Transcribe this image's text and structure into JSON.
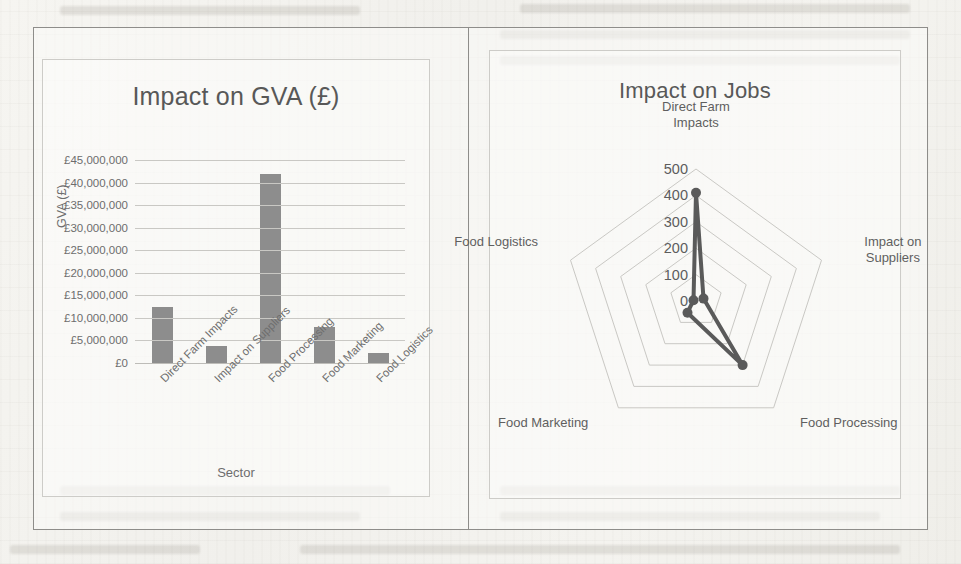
{
  "page": {
    "background_color": "#f3f2ee",
    "frame_border_color": "#8e8d8a",
    "chart_border_color": "#cdccc8"
  },
  "charts": {
    "gva": {
      "title": "Impact on GVA (£)",
      "xlabel": "Sector",
      "ylabel": "GVA (£)",
      "series_color": "#8d8d8d",
      "yticks": [
        "£0",
        "£5,000,000",
        "£10,000,000",
        "£15,000,000",
        "£20,000,000",
        "£25,000,000",
        "£30,000,000",
        "£35,000,000",
        "£40,000,000",
        "£45,000,000"
      ],
      "categories": [
        "Direct Farm Impacts",
        "Impact on Suppliers",
        "Food Processing",
        "Food Marketing",
        "Food Logistics"
      ]
    },
    "jobs": {
      "title": "Impact on Jobs",
      "series_color": "#5a5a5a",
      "grid_color": "#c9c8c4",
      "ticks": [
        "0",
        "100",
        "200",
        "300",
        "400",
        "500"
      ],
      "axis_labels": [
        "Direct Farm\nImpacts",
        "Impact on\nSuppliers",
        "Food Processing",
        "Food Marketing",
        "Food Logistics"
      ]
    }
  },
  "chart_data": [
    {
      "type": "bar",
      "title": "Impact on GVA (£)",
      "xlabel": "Sector",
      "ylabel": "GVA (£)",
      "ylim": [
        0,
        45000000
      ],
      "ytick_step": 5000000,
      "grid": true,
      "legend": "none",
      "categories": [
        "Direct Farm Impacts",
        "Impact on Suppliers",
        "Food Processing",
        "Food Marketing",
        "Food Logistics"
      ],
      "values": [
        12400000,
        3700000,
        42000000,
        8000000,
        2300000
      ],
      "tick_labels": [
        "£0",
        "£5,000,000",
        "£10,000,000",
        "£15,000,000",
        "£20,000,000",
        "£25,000,000",
        "£30,000,000",
        "£35,000,000",
        "£40,000,000",
        "£45,000,000"
      ]
    },
    {
      "type": "line",
      "subtype": "radar",
      "title": "Impact on Jobs",
      "xlabel": "",
      "ylabel": "",
      "ylim": [
        0,
        500
      ],
      "ytick_step": 100,
      "grid": true,
      "legend": "none",
      "categories": [
        "Direct Farm Impacts",
        "Impact on Suppliers",
        "Food Processing",
        "Food Marketing",
        "Food Logistics"
      ],
      "values": [
        410,
        30,
        300,
        55,
        10
      ],
      "tick_labels": [
        "0",
        "100",
        "200",
        "300",
        "400",
        "500"
      ]
    }
  ]
}
